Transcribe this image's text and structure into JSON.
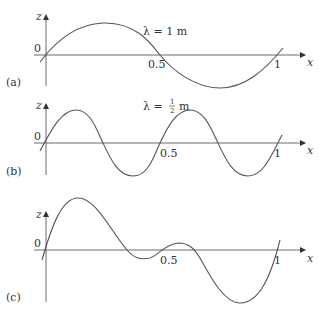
{
  "figure": {
    "panels": [
      {
        "id": "a",
        "panel_label": "(a)",
        "wavelength_label": "λ = 1 m",
        "axis_x_label": "x",
        "axis_z_label": "z",
        "origin_label": "0",
        "tick_mid": "0.5",
        "tick_end": "1"
      },
      {
        "id": "b",
        "panel_label": "(b)",
        "wavelength_prefix": "λ = ",
        "wavelength_num": "1",
        "wavelength_den": "2",
        "wavelength_unit": "m",
        "axis_x_label": "x",
        "axis_z_label": "z",
        "origin_label": "0",
        "tick_mid": "0.5",
        "tick_end": "1"
      },
      {
        "id": "c",
        "panel_label": "(c)",
        "axis_x_label": "x",
        "axis_z_label": "z",
        "origin_label": "0",
        "tick_mid": "0.5",
        "tick_end": "1"
      }
    ],
    "colors": {
      "axis": "#6a6a6a",
      "curve": "#555555",
      "text": "#333333"
    }
  }
}
